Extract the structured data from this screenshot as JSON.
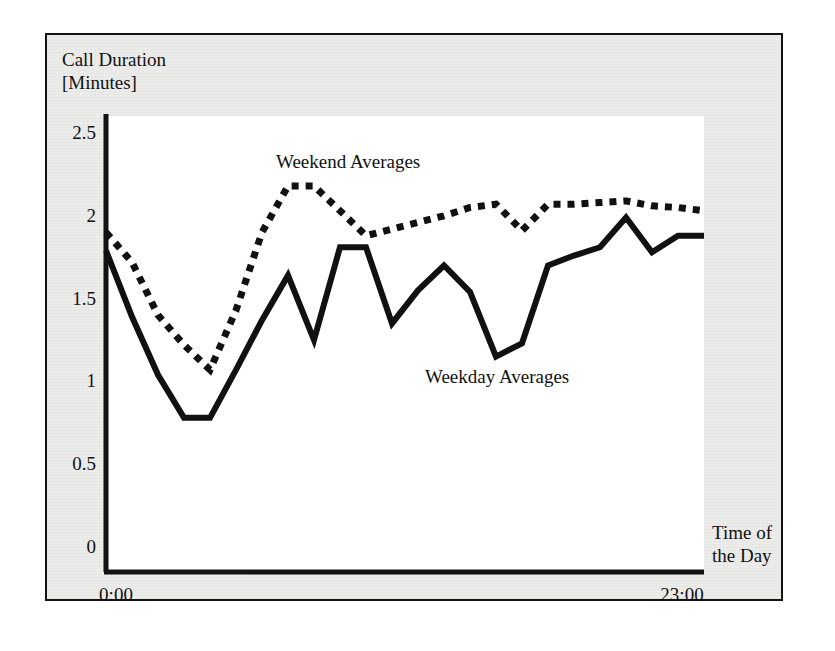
{
  "chart_data": {
    "type": "line",
    "title": "",
    "xlabel": "Time of the Day",
    "ylabel": "Call Duration [Minutes]",
    "ylabel_line1": "Call Duration",
    "ylabel_line2": "[Minutes]",
    "xlabel_line1": "Time of",
    "xlabel_line2": "the Day",
    "ylim": [
      0,
      2.6
    ],
    "yticks": [
      0,
      0.5,
      1,
      1.5,
      2,
      2.5
    ],
    "ytick_labels": [
      "0",
      "0.5",
      "1",
      "1.5",
      "2",
      "2.5"
    ],
    "xlim": [
      0,
      23
    ],
    "xticks": [
      0,
      23
    ],
    "xtick_labels": [
      "0:00",
      "23:00"
    ],
    "grid": false,
    "legend_position": "inline-annotation",
    "annotations": [
      {
        "text": "Weekend Averages",
        "x": 7.1,
        "y": 2.38
      },
      {
        "text": "Weekday Averages",
        "x": 13.2,
        "y": 1.12
      }
    ],
    "x": [
      0,
      1,
      2,
      3,
      4,
      5,
      6,
      7,
      8,
      9,
      10,
      11,
      12,
      13,
      14,
      15,
      16,
      17,
      18,
      19,
      20,
      21,
      22,
      23
    ],
    "series": [
      {
        "name": "Weekday Averages",
        "style": "solid",
        "color": "#111111",
        "values": [
          1.79,
          1.39,
          1.04,
          0.78,
          0.78,
          1.07,
          1.37,
          1.64,
          1.25,
          1.81,
          1.81,
          1.35,
          1.55,
          1.7,
          1.54,
          1.15,
          1.23,
          1.7,
          1.76,
          1.81,
          1.99,
          1.78,
          1.88,
          1.88
        ]
      },
      {
        "name": "Weekend Averages",
        "style": "dotted",
        "color": "#111111",
        "values": [
          1.9,
          1.72,
          1.4,
          1.22,
          1.07,
          1.43,
          1.9,
          2.18,
          2.18,
          2.03,
          1.88,
          1.92,
          1.96,
          2.0,
          2.05,
          2.07,
          1.91,
          2.07,
          2.07,
          2.08,
          2.09,
          2.06,
          2.05,
          2.03
        ]
      }
    ]
  },
  "axis": {
    "y_axis_name": "vertical-axis",
    "x_axis_name": "horizontal-axis"
  }
}
